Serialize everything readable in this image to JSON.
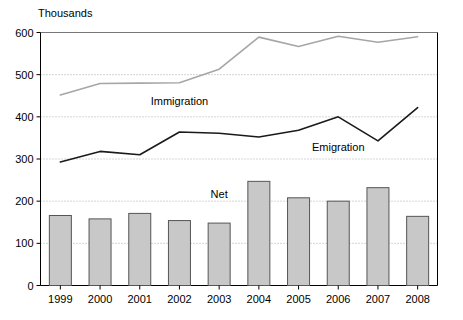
{
  "chart_data": {
    "type": "bar",
    "title": "",
    "subtitle": "",
    "unit_label": "Thousands",
    "xlabel": "",
    "ylabel": "",
    "ylim": [
      0,
      600
    ],
    "ytick_step": 100,
    "yticks": [
      "0",
      "100",
      "200",
      "300",
      "400",
      "500",
      "600"
    ],
    "grid": true,
    "grid_style": "dotted-horizontal",
    "legend_position": "inline-annotations",
    "categories": [
      "1999",
      "2000",
      "2001",
      "2002",
      "2003",
      "2004",
      "2005",
      "2006",
      "2007",
      "2008"
    ],
    "series": [
      {
        "name": "Net",
        "type": "bar",
        "color": "#c8c8c8",
        "edge_color": "#555555",
        "values": [
          166,
          158,
          171,
          154,
          148,
          247,
          208,
          200,
          232,
          164
        ]
      },
      {
        "name": "Immigration",
        "type": "line",
        "color": "#a6a6a6",
        "values": [
          452,
          479,
          480,
          481,
          513,
          589,
          567,
          591,
          577,
          590
        ]
      },
      {
        "name": "Emigration",
        "type": "line",
        "color": "#1a1a1a",
        "values": [
          293,
          318,
          310,
          364,
          361,
          352,
          368,
          400,
          343,
          422
        ]
      }
    ],
    "annotations": [
      {
        "text": "Immigration",
        "x_category": "2002",
        "y_value": 428
      },
      {
        "text": "Emigration",
        "x_category": "2006",
        "y_value": 318
      },
      {
        "text": "Net",
        "x_category": "2003",
        "y_value": 208
      }
    ]
  },
  "colors": {
    "bar_fill": "#c8c8c8",
    "bar_edge": "#555555",
    "immigration_line": "#a6a6a6",
    "emigration_line": "#1a1a1a",
    "axis": "#000000",
    "grid": "#aaaaaa",
    "background": "#ffffff"
  }
}
